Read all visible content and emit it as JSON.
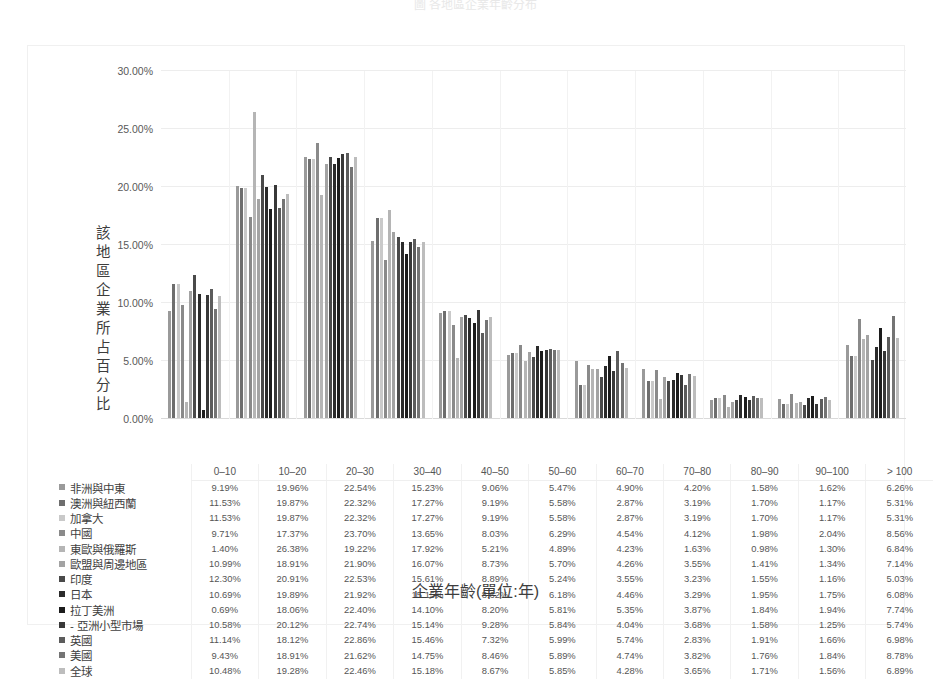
{
  "top_title_fragment": "圖   各地區企業年齡分布",
  "axis": {
    "y_label": "該地區企業所占百分比",
    "x_title": "企業年齡(單位:年)",
    "y_ticks": [
      "30.00%",
      "25.00%",
      "20.00%",
      "15.00%",
      "10.00%",
      "5.00%",
      "0.00%"
    ]
  },
  "chart_data": {
    "type": "bar",
    "title": "各地區企業年齡分布",
    "xlabel": "企業年齡(單位:年)",
    "ylabel": "該地區企業所占百分比",
    "ylim": [
      0,
      30
    ],
    "ytick_values": [
      0,
      5,
      10,
      15,
      20,
      25,
      30
    ],
    "grid": true,
    "legend_position": "table-left",
    "categories": [
      "0–10",
      "10–20",
      "20–30",
      "30–40",
      "40–50",
      "50–60",
      "60–70",
      "70–80",
      "80–90",
      "90–100",
      "> 100"
    ],
    "series": [
      {
        "name": "非洲與中東",
        "color": "#9a9a9a",
        "values": [
          9.19,
          19.96,
          22.54,
          15.23,
          9.06,
          5.47,
          4.9,
          4.2,
          1.58,
          1.62,
          6.26
        ],
        "labels": [
          "9.19%",
          "19.96%",
          "22.54%",
          "15.23%",
          "9.06%",
          "5.47%",
          "4.90%",
          "4.20%",
          "1.58%",
          "1.62%",
          "6.26%"
        ]
      },
      {
        "name": "澳洲與紐西蘭",
        "color": "#6e6e6e",
        "values": [
          11.53,
          19.87,
          22.32,
          17.27,
          9.19,
          5.58,
          2.87,
          3.19,
          1.7,
          1.17,
          5.31
        ],
        "labels": [
          "11.53%",
          "19.87%",
          "22.32%",
          "17.27%",
          "9.19%",
          "5.58%",
          "2.87%",
          "3.19%",
          "1.70%",
          "1.17%",
          "5.31%"
        ]
      },
      {
        "name": "加拿大",
        "color": "#c9c9c9",
        "values": [
          11.53,
          19.87,
          22.32,
          17.27,
          9.19,
          5.58,
          2.87,
          3.19,
          1.7,
          1.17,
          5.31
        ],
        "labels": [
          "11.53%",
          "19.87%",
          "22.32%",
          "17.27%",
          "9.19%",
          "5.58%",
          "2.87%",
          "3.19%",
          "1.70%",
          "1.17%",
          "5.31%"
        ]
      },
      {
        "name": "中國",
        "color": "#8a8a8a",
        "values": [
          9.71,
          17.37,
          23.7,
          13.65,
          8.03,
          6.29,
          4.54,
          4.12,
          1.98,
          2.04,
          8.56
        ],
        "labels": [
          "9.71%",
          "17.37%",
          "23.70%",
          "13.65%",
          "8.03%",
          "6.29%",
          "4.54%",
          "4.12%",
          "1.98%",
          "2.04%",
          "8.56%"
        ]
      },
      {
        "name": "東歐與俄羅斯",
        "color": "#b5b5b5",
        "values": [
          1.4,
          26.38,
          19.22,
          17.92,
          5.21,
          4.89,
          4.23,
          1.63,
          0.98,
          1.3,
          6.84
        ],
        "labels": [
          "1.40%",
          "26.38%",
          "19.22%",
          "17.92%",
          "5.21%",
          "4.89%",
          "4.23%",
          "1.63%",
          "0.98%",
          "1.30%",
          "6.84%"
        ]
      },
      {
        "name": "歐盟與周邊地區",
        "color": "#a3a3a3",
        "values": [
          10.99,
          18.91,
          21.9,
          16.07,
          8.73,
          5.7,
          4.26,
          3.55,
          1.41,
          1.34,
          7.14
        ],
        "labels": [
          "10.99%",
          "18.91%",
          "21.90%",
          "16.07%",
          "8.73%",
          "5.70%",
          "4.26%",
          "3.55%",
          "1.41%",
          "1.34%",
          "7.14%"
        ]
      },
      {
        "name": "印度",
        "color": "#4a4a4a",
        "values": [
          12.3,
          20.91,
          22.53,
          15.61,
          8.89,
          5.24,
          3.55,
          3.23,
          1.55,
          1.16,
          5.03
        ],
        "labels": [
          "12.30%",
          "20.91%",
          "22.53%",
          "15.61%",
          "8.89%",
          "5.24%",
          "3.55%",
          "3.23%",
          "1.55%",
          "1.16%",
          "5.03%"
        ]
      },
      {
        "name": "日本",
        "color": "#2b2b2b",
        "values": [
          10.69,
          19.89,
          21.92,
          15.15,
          8.62,
          6.18,
          4.46,
          3.29,
          1.95,
          1.75,
          6.08
        ],
        "labels": [
          "10.69%",
          "19.89%",
          "21.92%",
          "15.15%",
          "8.62%",
          "6.18%",
          "4.46%",
          "3.29%",
          "1.95%",
          "1.75%",
          "6.08%"
        ]
      },
      {
        "name": "拉丁美洲",
        "color": "#1c1c1c",
        "values": [
          0.69,
          18.06,
          22.4,
          14.1,
          8.2,
          5.81,
          5.35,
          3.87,
          1.84,
          1.94,
          7.74
        ],
        "labels": [
          "0.69%",
          "18.06%",
          "22.40%",
          "14.10%",
          "8.20%",
          "5.81%",
          "5.35%",
          "3.87%",
          "1.84%",
          "1.94%",
          "7.74%"
        ]
      },
      {
        "name": "- 亞洲小型市場",
        "color": "#383838",
        "values": [
          10.58,
          20.12,
          22.74,
          15.14,
          9.28,
          5.84,
          4.04,
          3.68,
          1.58,
          1.25,
          5.74
        ],
        "labels": [
          "10.58%",
          "20.12%",
          "22.74%",
          "15.14%",
          "9.28%",
          "5.84%",
          "4.04%",
          "3.68%",
          "1.58%",
          "1.25%",
          "5.74%"
        ]
      },
      {
        "name": "英國",
        "color": "#5c5c5c",
        "values": [
          11.14,
          18.12,
          22.86,
          15.46,
          7.32,
          5.99,
          5.74,
          2.83,
          1.91,
          1.66,
          6.98
        ],
        "labels": [
          "11.14%",
          "18.12%",
          "22.86%",
          "15.46%",
          "7.32%",
          "5.99%",
          "5.74%",
          "2.83%",
          "1.91%",
          "1.66%",
          "6.98%"
        ]
      },
      {
        "name": "美國",
        "color": "#747474",
        "values": [
          9.43,
          18.91,
          21.62,
          14.75,
          8.46,
          5.89,
          4.74,
          3.82,
          1.76,
          1.84,
          8.78
        ],
        "labels": [
          "9.43%",
          "18.91%",
          "21.62%",
          "14.75%",
          "8.46%",
          "5.89%",
          "4.74%",
          "3.82%",
          "1.76%",
          "1.84%",
          "8.78%"
        ]
      },
      {
        "name": "全球",
        "color": "#bdbdbd",
        "values": [
          10.48,
          19.28,
          22.46,
          15.18,
          8.67,
          5.85,
          4.28,
          3.65,
          1.71,
          1.56,
          6.89
        ],
        "labels": [
          "10.48%",
          "19.28%",
          "22.46%",
          "15.18%",
          "8.67%",
          "5.85%",
          "4.28%",
          "3.65%",
          "1.71%",
          "1.56%",
          "6.89%"
        ]
      }
    ]
  }
}
